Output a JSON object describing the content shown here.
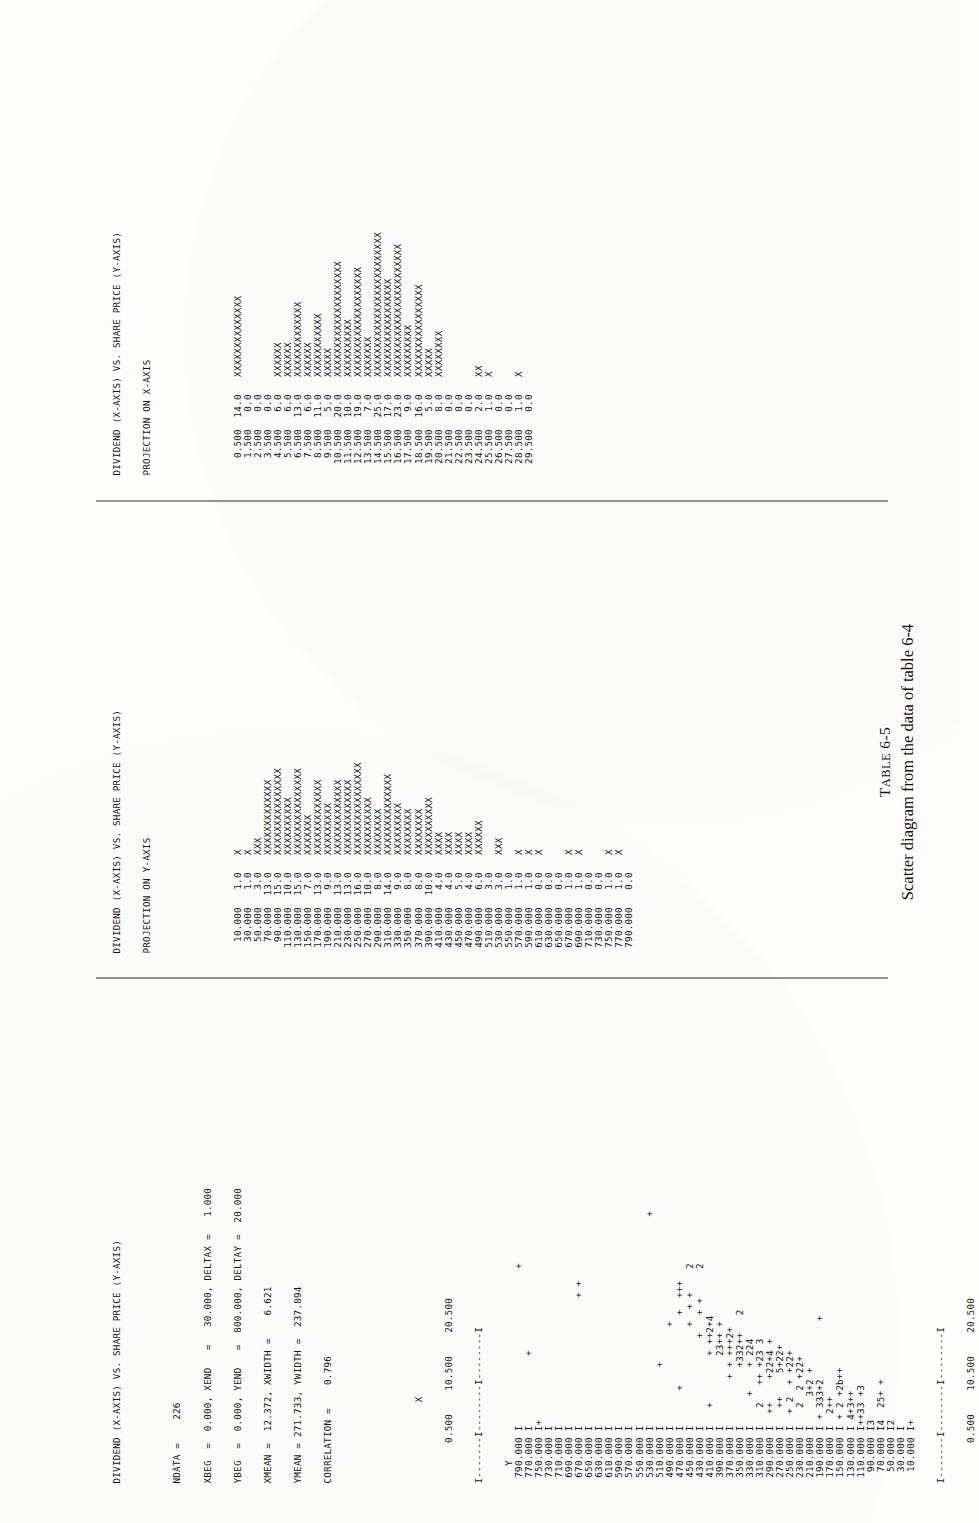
{
  "page": {
    "orientation": "rotated-90-ccw",
    "background": "#fdfdfb",
    "ink": "#16161a"
  },
  "caption": {
    "table_label_small_caps": "T",
    "table_label": "ABLE",
    "table_number": "6-5",
    "text": "Scatter diagram from the data of table 6-4"
  },
  "scatter_panel": {
    "title": "DIVIDEND (X-AXIS) VS. SHARE PRICE (Y-AXIS)",
    "stats": [
      "NDATA =    226",
      "XBEG  =  0.000, XEND   =   30.000, DELTAX =   1.000",
      "YBEG  =  0.000, YEND   =  800.000, DELTAY =  20.000",
      "XMEAN =  12.372, XWIDTH =    6.621",
      "YMEAN = 271.733, YWIDTH =  237.894",
      "CORRELATION =    0.796"
    ],
    "x_axis_label": "X",
    "y_axis_label": "Y",
    "x_ticks": [
      "0.500",
      "10.500",
      "20.500"
    ],
    "axis_top": "I-------I--------I--------I",
    "axis_bottom": "I-------I--------I--------I",
    "rows": [
      {
        "y": "790.000",
        "plot": "                           +"
      },
      {
        "y": "770.000",
        "plot": "            +"
      },
      {
        "y": "750.000",
        "plot": "+"
      },
      {
        "y": "730.000",
        "plot": ""
      },
      {
        "y": "710.000",
        "plot": ""
      },
      {
        "y": "690.000",
        "plot": ""
      },
      {
        "y": "670.000",
        "plot": "                      + +"
      },
      {
        "y": "650.000",
        "plot": ""
      },
      {
        "y": "630.000",
        "plot": ""
      },
      {
        "y": "610.000",
        "plot": ""
      },
      {
        "y": "590.000",
        "plot": ""
      },
      {
        "y": "570.000",
        "plot": ""
      },
      {
        "y": "550.000",
        "plot": ""
      },
      {
        "y": "530.000",
        "plot": "                                    +"
      },
      {
        "y": "510.000",
        "plot": "          +"
      },
      {
        "y": "490.000",
        "plot": "                 +"
      },
      {
        "y": "470.000",
        "plot": "      +            +  +++"
      },
      {
        "y": "450.000",
        "plot": "                 +  + +    2"
      },
      {
        "y": "430.000",
        "plot": "               +   + +     2"
      },
      {
        "y": "410.000",
        "plot": "   +        + ++2+4"
      },
      {
        "y": "390.000",
        "plot": "            23++ +"
      },
      {
        "y": "370.000",
        "plot": "        + + +++2+"
      },
      {
        "y": "350.000",
        "plot": "          +332++   2"
      },
      {
        "y": "330.000",
        "plot": "     +    + 224"
      },
      {
        "y": "310.000",
        "plot": "   2   ++ +23 3"
      },
      {
        "y": "290.000",
        "plot": "  ++    +22+4 +"
      },
      {
        "y": "270.000",
        "plot": "   ++    5+22+"
      },
      {
        "y": "250.000",
        "plot": "  + 2  + +22+"
      },
      {
        "y": "230.000",
        "plot": "   2  2 +22+"
      },
      {
        "y": "210.000",
        "plot": "     3+2 +"
      },
      {
        "y": "190.000",
        "plot": " + 333+2          +"
      },
      {
        "y": "170.000",
        "plot": "  2++"
      },
      {
        "y": "150.000",
        "plot": " + 2 +2b++"
      },
      {
        "y": "130.000",
        "plot": " 4+3++"
      },
      {
        "y": "110.000",
        "plot": "++33 +3"
      },
      {
        "y": "90.000",
        "plot": "3"
      },
      {
        "y": "70.000",
        "plot": "4  25+ +"
      },
      {
        "y": "50.000",
        "plot": "2"
      },
      {
        "y": "30.000",
        "plot": ""
      },
      {
        "y": "10.000",
        "plot": "+"
      }
    ]
  },
  "yproj_panel": {
    "title": "DIVIDEND (X-AXIS) VS. SHARE PRICE (Y-AXIS)",
    "subtitle": "PROJECTION ON Y-AXIS",
    "rows": [
      {
        "bin": "10.000",
        "count": "1.0",
        "bar": "X"
      },
      {
        "bin": "30.000",
        "count": "1.0",
        "bar": "X"
      },
      {
        "bin": "50.000",
        "count": "3.0",
        "bar": "XXX"
      },
      {
        "bin": "70.000",
        "count": "13.0",
        "bar": "XXXXXXXXXXXXX"
      },
      {
        "bin": "90.000",
        "count": "15.0",
        "bar": "XXXXXXXXXXXXXXX"
      },
      {
        "bin": "110.000",
        "count": "10.0",
        "bar": "XXXXXXXXXX"
      },
      {
        "bin": "130.000",
        "count": "15.0",
        "bar": "XXXXXXXXXXXXXXX"
      },
      {
        "bin": "150.000",
        "count": "7.0",
        "bar": "XXXXXXX"
      },
      {
        "bin": "170.000",
        "count": "13.0",
        "bar": "XXXXXXXXXXXXX"
      },
      {
        "bin": "190.000",
        "count": "9.0",
        "bar": "XXXXXXXXX"
      },
      {
        "bin": "210.000",
        "count": "13.0",
        "bar": "XXXXXXXXXXXXX"
      },
      {
        "bin": "230.000",
        "count": "13.0",
        "bar": "XXXXXXXXXXXXX"
      },
      {
        "bin": "250.000",
        "count": "16.0",
        "bar": "XXXXXXXXXXXXXXXX"
      },
      {
        "bin": "270.000",
        "count": "10.0",
        "bar": "XXXXXXXXXX"
      },
      {
        "bin": "290.000",
        "count": "8.0",
        "bar": "XXXXXXXX"
      },
      {
        "bin": "310.000",
        "count": "14.0",
        "bar": "XXXXXXXXXXXXXX"
      },
      {
        "bin": "330.000",
        "count": "9.0",
        "bar": "XXXXXXXXX"
      },
      {
        "bin": "350.000",
        "count": "8.0",
        "bar": "XXXXXXXX"
      },
      {
        "bin": "370.000",
        "count": "8.0",
        "bar": "XXXXXXXX"
      },
      {
        "bin": "390.000",
        "count": "10.0",
        "bar": "XXXXXXXXXX"
      },
      {
        "bin": "410.000",
        "count": "4.0",
        "bar": "XXXX"
      },
      {
        "bin": "430.000",
        "count": "4.0",
        "bar": "XXXX"
      },
      {
        "bin": "450.000",
        "count": "5.0",
        "bar": "XXXX"
      },
      {
        "bin": "470.000",
        "count": "4.0",
        "bar": "XXXX"
      },
      {
        "bin": "490.000",
        "count": "6.0",
        "bar": "XXXXXX"
      },
      {
        "bin": "510.000",
        "count": "3.0",
        "bar": ""
      },
      {
        "bin": "530.000",
        "count": "3.0",
        "bar": "XXX"
      },
      {
        "bin": "550.000",
        "count": "1.0",
        "bar": ""
      },
      {
        "bin": "570.000",
        "count": "1.0",
        "bar": "X"
      },
      {
        "bin": "590.000",
        "count": "1.0",
        "bar": "X"
      },
      {
        "bin": "610.000",
        "count": "0.0",
        "bar": "X"
      },
      {
        "bin": "630.000",
        "count": "0.0",
        "bar": ""
      },
      {
        "bin": "650.000",
        "count": "0.0",
        "bar": ""
      },
      {
        "bin": "670.000",
        "count": "1.0",
        "bar": "X"
      },
      {
        "bin": "690.000",
        "count": "1.0",
        "bar": "X"
      },
      {
        "bin": "710.000",
        "count": "0.0",
        "bar": ""
      },
      {
        "bin": "730.000",
        "count": "0.0",
        "bar": ""
      },
      {
        "bin": "750.000",
        "count": "1.0",
        "bar": "X"
      },
      {
        "bin": "770.000",
        "count": "1.0",
        "bar": "X"
      },
      {
        "bin": "790.000",
        "count": "0.0",
        "bar": ""
      }
    ]
  },
  "xproj_panel": {
    "title": "DIVIDEND (X-AXIS) VS. SHARE PRICE (Y-AXIS)",
    "subtitle": "PROJECTION ON X-AXIS",
    "rows": [
      {
        "bin": "0.500",
        "count": "14.0",
        "bar": "XXXXXXXXXXXXXX"
      },
      {
        "bin": "1.500",
        "count": "0.0",
        "bar": ""
      },
      {
        "bin": "2.500",
        "count": "0.0",
        "bar": ""
      },
      {
        "bin": "3.500",
        "count": "0.0",
        "bar": ""
      },
      {
        "bin": "4.500",
        "count": "6.0",
        "bar": "XXXXXX"
      },
      {
        "bin": "5.500",
        "count": "6.0",
        "bar": "XXXXXX"
      },
      {
        "bin": "6.500",
        "count": "13.0",
        "bar": "XXXXXXXXXXXXX"
      },
      {
        "bin": "7.500",
        "count": "6.0",
        "bar": "XXXXXX"
      },
      {
        "bin": "8.500",
        "count": "11.0",
        "bar": "XXXXXXXXXXX"
      },
      {
        "bin": "9.500",
        "count": "5.0",
        "bar": "XXXXX"
      },
      {
        "bin": "10.500",
        "count": "20.0",
        "bar": "XXXXXXXXXXXXXXXXXXXX"
      },
      {
        "bin": "11.500",
        "count": "10.0",
        "bar": "XXXXXXXXXX"
      },
      {
        "bin": "12.500",
        "count": "19.0",
        "bar": "XXXXXXXXXXXXXXXXXXX"
      },
      {
        "bin": "13.500",
        "count": "7.0",
        "bar": "XXXXXXX"
      },
      {
        "bin": "14.500",
        "count": "25.0",
        "bar": "XXXXXXXXXXXXXXXXXXXXXXXXX"
      },
      {
        "bin": "15.500",
        "count": "17.0",
        "bar": "XXXXXXXXXXXXXXXXX"
      },
      {
        "bin": "16.500",
        "count": "23.0",
        "bar": "XXXXXXXXXXXXXXXXXXXXXXX"
      },
      {
        "bin": "17.500",
        "count": "9.0",
        "bar": "XXXXXXXXX"
      },
      {
        "bin": "18.500",
        "count": "16.0",
        "bar": "XXXXXXXXXXXXXXXX"
      },
      {
        "bin": "19.500",
        "count": "5.0",
        "bar": "XXXXX"
      },
      {
        "bin": "20.500",
        "count": "8.0",
        "bar": "XXXXXXXX"
      },
      {
        "bin": "21.500",
        "count": "0.0",
        "bar": ""
      },
      {
        "bin": "22.500",
        "count": "0.0",
        "bar": ""
      },
      {
        "bin": "23.500",
        "count": "0.0",
        "bar": ""
      },
      {
        "bin": "24.500",
        "count": "2.0",
        "bar": "XX"
      },
      {
        "bin": "25.500",
        "count": "1.0",
        "bar": "X"
      },
      {
        "bin": "26.500",
        "count": "0.0",
        "bar": ""
      },
      {
        "bin": "27.500",
        "count": "0.0",
        "bar": ""
      },
      {
        "bin": "28.500",
        "count": "1.0",
        "bar": "X"
      },
      {
        "bin": "29.500",
        "count": "0.0",
        "bar": ""
      }
    ]
  },
  "chart_data": {
    "type": "scatter",
    "title": "DIVIDEND (X-AXIS) VS. SHARE PRICE (Y-AXIS)",
    "xlabel": "X",
    "ylabel": "Y",
    "xlim": [
      0.0,
      30.0
    ],
    "ylim": [
      0.0,
      800.0
    ],
    "x_tick_labels": [
      "0.500",
      "10.500",
      "20.500"
    ],
    "y_tick_labels": [
      "790.000",
      "770.000",
      "750.000",
      "730.000",
      "710.000",
      "690.000",
      "670.000",
      "650.000",
      "630.000",
      "610.000",
      "590.000",
      "570.000",
      "550.000",
      "530.000",
      "510.000",
      "490.000",
      "470.000",
      "450.000",
      "430.000",
      "410.000",
      "390.000",
      "370.000",
      "350.000",
      "330.000",
      "310.000",
      "290.000",
      "270.000",
      "250.000",
      "230.000",
      "210.000",
      "190.000",
      "170.000",
      "150.000",
      "130.000",
      "110.000",
      "90.000",
      "70.000",
      "50.000",
      "30.000",
      "10.000"
    ],
    "ndata": 226,
    "xbeg": 0.0,
    "xend": 30.0,
    "deltax": 1.0,
    "ybeg": 0.0,
    "yend": 800.0,
    "deltay": 20.0,
    "xmean": 12.372,
    "xwidth": 6.621,
    "ymean": 271.733,
    "ywidth": 237.894,
    "correlation": 0.796,
    "marker_symbols": {
      "single": "+",
      "multiple": "digit count 2-9"
    },
    "grid": false,
    "legend": "none",
    "projection_x": {
      "bins": [
        0.5,
        1.5,
        2.5,
        3.5,
        4.5,
        5.5,
        6.5,
        7.5,
        8.5,
        9.5,
        10.5,
        11.5,
        12.5,
        13.5,
        14.5,
        15.5,
        16.5,
        17.5,
        18.5,
        19.5,
        20.5,
        21.5,
        22.5,
        23.5,
        24.5,
        25.5,
        26.5,
        27.5,
        28.5,
        29.5
      ],
      "counts": [
        14,
        0,
        0,
        0,
        6,
        6,
        13,
        6,
        11,
        5,
        20,
        10,
        19,
        7,
        25,
        17,
        23,
        9,
        16,
        5,
        8,
        0,
        0,
        0,
        2,
        1,
        0,
        0,
        1,
        0
      ]
    },
    "projection_y": {
      "bins": [
        10,
        30,
        50,
        70,
        90,
        110,
        130,
        150,
        170,
        190,
        210,
        230,
        250,
        270,
        290,
        310,
        330,
        350,
        370,
        390,
        410,
        430,
        450,
        470,
        490,
        510,
        530,
        550,
        570,
        590,
        610,
        630,
        650,
        670,
        690,
        710,
        730,
        750,
        770,
        790
      ],
      "counts": [
        1,
        1,
        3,
        13,
        15,
        10,
        15,
        7,
        13,
        9,
        13,
        13,
        16,
        10,
        8,
        14,
        9,
        8,
        8,
        10,
        4,
        4,
        5,
        4,
        6,
        3,
        3,
        1,
        1,
        1,
        0,
        0,
        0,
        1,
        1,
        0,
        0,
        1,
        1,
        0
      ]
    }
  }
}
